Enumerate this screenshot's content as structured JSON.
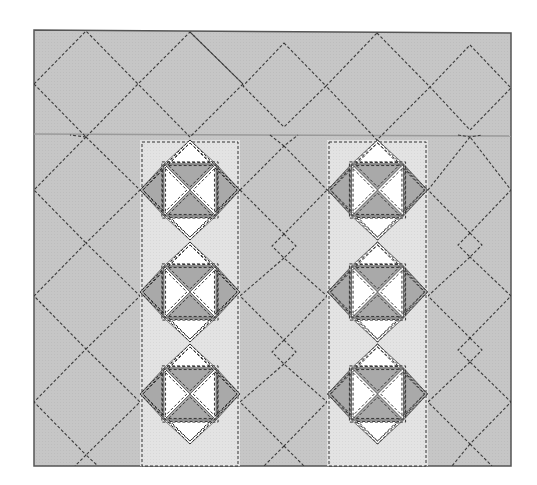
{
  "diagram": {
    "type": "quilt-layout",
    "title": "",
    "canvas": {
      "width": 537,
      "height": 485
    },
    "quilt": {
      "x": 34,
      "y": 30,
      "width": 477,
      "height": 436
    },
    "border": {
      "top": 30,
      "bottom": 135,
      "label": "top border with diamond quilting"
    },
    "colors": {
      "background_fabric": "#c8c8c8",
      "strip_fabric": "#e2e2e2",
      "dark_triangle": "#a9a9a9",
      "white_triangle": "#ffffff",
      "outline": "#555555",
      "stitch": "#333333",
      "border_seam": "#9a9a9a"
    },
    "strips": [
      {
        "name": "left-strip",
        "x": 140,
        "width": 100,
        "center_x": 190
      },
      {
        "name": "right-strip",
        "x": 327,
        "width": 101,
        "center_x": 377.5
      }
    ],
    "block_centers_y": [
      190,
      292,
      394
    ],
    "block": {
      "diamond_half": 50,
      "inner_square_half": 26,
      "description": "Square-in-square block: outer diamond on point; corners white (top/bottom) and dark (left/right); inner square with hourglass — dark triangles top/bottom, white left/right"
    },
    "background_quilting": {
      "style": "dashed diagonal grid",
      "dash": "3,2"
    }
  }
}
